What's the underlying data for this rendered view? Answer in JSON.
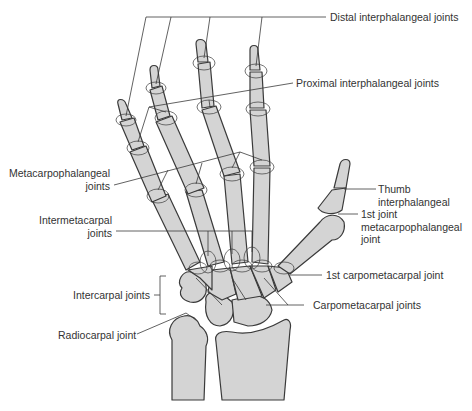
{
  "diagram": {
    "background": "#ffffff",
    "bone_fill": "#d4d4d4",
    "outline_color": "#3a3a3a",
    "text_color": "#333333",
    "labels": {
      "distal_ip": "Distal interphalangeal joints",
      "proximal_ip": "Proximal interphalangeal joints",
      "mcp_line1": "Metacarpophalangeal",
      "mcp_line2": "joints",
      "intermetacarpal_line1": "Intermetacarpal",
      "intermetacarpal_line2": "joints",
      "intercarpal": "Intercarpal joints",
      "radiocarpal": "Radiocarpal joint",
      "thumb_ip_line1": "Thumb",
      "thumb_ip_line2": "interphalangeal",
      "thumb_ip_line3": "joint",
      "first_mcp_line1": "1st",
      "first_mcp_line2": "metacarpophalangeal",
      "first_mcp_line3": "joint",
      "first_cmc": "1st carpometacarpal joint",
      "cmc": "Carpometacarpal joints"
    }
  }
}
